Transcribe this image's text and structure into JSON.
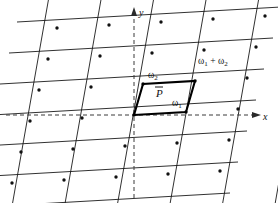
{
  "figure": {
    "background_color": "#ffffff",
    "line_color": "#1a1a1a",
    "axis_color": "#3a3a3a",
    "cell_color": "#000000",
    "width": 278,
    "height": 203
  },
  "axes": {
    "x_label": "x",
    "y_label": "y",
    "origin_x": 134,
    "origin_y": 115,
    "x_axis_style": "dashed",
    "y_axis_style": "dashed"
  },
  "labels": {
    "omega1": "ω",
    "omega1_sub": "1",
    "omega2": "ω",
    "omega2_sub": "2",
    "omega_sum_first": "ω",
    "omega_sum_first_sub": "1",
    "omega_sum_plus": "+",
    "omega_sum_second": "ω",
    "omega_sum_second_sub": "2",
    "region": "P"
  },
  "chart_data": {
    "type": "scatter",
    "xlabel": "x",
    "ylabel": "y",
    "grid": true,
    "legend": null,
    "basis_vectors": [
      {
        "name": "ω1",
        "dx": 52,
        "dy": -3
      },
      {
        "name": "ω2",
        "dx": 9,
        "dy": -31
      }
    ],
    "origin": [
      134,
      115
    ],
    "lattice_range": {
      "m_min": -3,
      "m_max": 2,
      "n_min": -2,
      "n_max": 3
    },
    "marked_vertices": [
      {
        "label": "origin",
        "m": 0,
        "n": 0
      },
      {
        "label": "ω1",
        "m": 1,
        "n": 0
      },
      {
        "label": "ω2",
        "m": 0,
        "n": 1
      },
      {
        "label": "ω1 + ω2",
        "m": 1,
        "n": 1
      }
    ],
    "annotations": [
      {
        "text": "ω2",
        "x": 152,
        "y": 76
      },
      {
        "text": "ω1",
        "x": 176,
        "y": 103
      },
      {
        "text": "ω1 + ω2",
        "x": 200,
        "y": 62
      },
      {
        "text": "P̄",
        "x": 160,
        "y": 95
      },
      {
        "text": "y",
        "x": 140,
        "y": 13
      },
      {
        "text": "x",
        "x": 266,
        "y": 120
      }
    ]
  }
}
